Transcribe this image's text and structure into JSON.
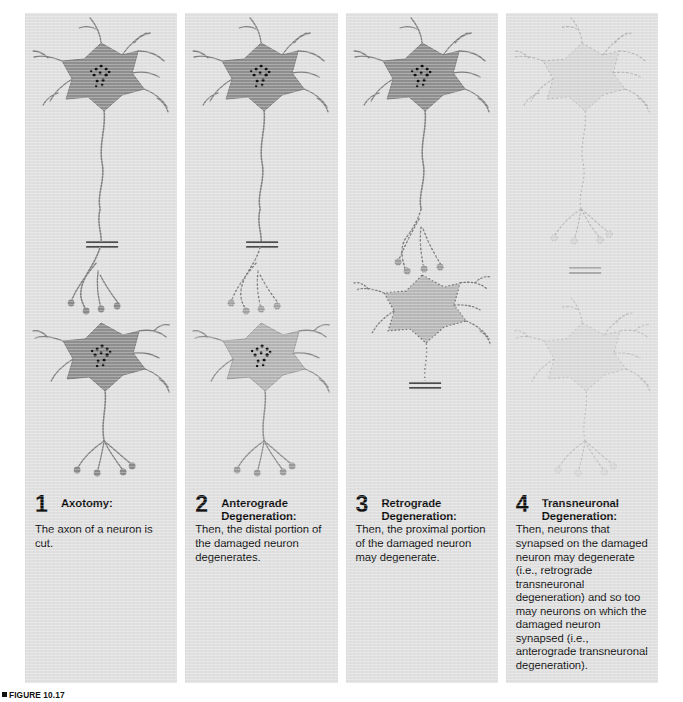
{
  "figure": {
    "label": "FIGURE 10.17",
    "background_color": "#ffffff",
    "panel_color": "#e0e0e0",
    "soma_dark_color": "#8f8f8f",
    "soma_light_color": "#b4b4b4",
    "soma_ghost_color": "#cfcfcf",
    "nucleus_color": "#111111",
    "process_color": "#7a7a7a"
  },
  "panels": [
    {
      "number": "1",
      "title": "Axotomy:",
      "body": "The axon of a neuron is cut.",
      "state": "healthy-with-cut"
    },
    {
      "number": "2",
      "title": "Anterograde Degeneration:",
      "body": "Then, the distal portion of the damaged neuron degenerates.",
      "state": "distal-degenerating"
    },
    {
      "number": "3",
      "title": "Retrograde Degeneration:",
      "body": "Then, the proximal portion of the damaged neuron may degenerate.",
      "state": "proximal-degenerating"
    },
    {
      "number": "4",
      "title": "Transneuronal Degeneration:",
      "body": "Then, neurons that synapsed on the damaged neuron may degenerate (i.e., retrograde transneuronal degeneration) and so too may neurons on which the damaged neuron synapsed (i.e., anterograde transneuronal degeneration).",
      "state": "all-ghosted"
    }
  ]
}
